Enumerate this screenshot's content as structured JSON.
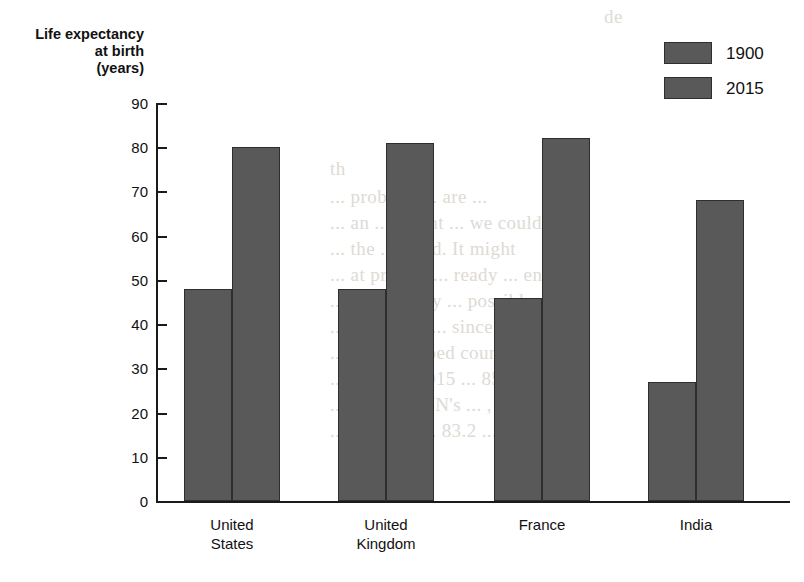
{
  "chart_data": {
    "type": "bar",
    "title": "",
    "xlabel": "",
    "ylabel": "Life expectancy\nat birth\n(years)",
    "ylim": [
      0,
      90
    ],
    "ytick_step": 10,
    "yticks": [
      "90",
      "80",
      "70",
      "60",
      "50",
      "40",
      "30",
      "20",
      "10",
      "0"
    ],
    "grid": false,
    "legend_position": "top-right",
    "categories": [
      "United\nStates",
      "United\nKingdom",
      "France",
      "India"
    ],
    "series": [
      {
        "name": "1900",
        "values": [
          48,
          48,
          46,
          27
        ],
        "color": "#595959"
      },
      {
        "name": "2015",
        "values": [
          80,
          81,
          82,
          68
        ],
        "color": "#595959"
      }
    ]
  },
  "axis": {
    "title": "Life expectancy\nat birth\n(years)"
  },
  "legend": {
    "entries": [
      {
        "label": "1900"
      },
      {
        "label": "2015"
      }
    ]
  },
  "colors": {
    "bar_fill": "#595959",
    "bar_stroke": "#2e2e2e",
    "axis": "#1a1a1a",
    "background": "#ffffff"
  },
  "background_bleed": [
    "de",
    "th",
    "... problem ... are ...",
    "... an ... recent ... we could be",
    "... the ... trend. It might",
    "... at present ... ready ... entirely",
    "... f. Certainly ... possible",
    "... et ... time ... since",
    "... so developed countries will",
    "... 1900 to 2015 ... 85-100",
    "... 2100. ... UN's ... , the",
    "... will rise ... 83.2 ..."
  ]
}
